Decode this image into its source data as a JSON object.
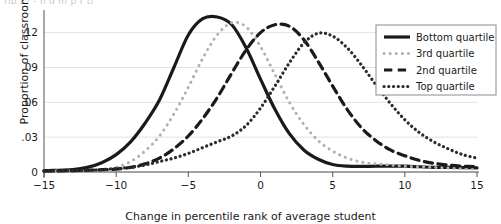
{
  "figure": {
    "caption_remnant": "rib f f ‑ h   d  m       p r          ti",
    "background": "#ffffff"
  },
  "chart_data": {
    "type": "line",
    "title": "",
    "subtitle": "",
    "xlabel": "Change in percentile rank of average student",
    "ylabel": "Proportion of classrooms",
    "xlim": [
      -15,
      15
    ],
    "ylim": [
      0,
      0.1395
    ],
    "xticks": [
      -15,
      -10,
      -5,
      0,
      5,
      10,
      15
    ],
    "xtick_labels": [
      "−15",
      "−10",
      "−5",
      "0",
      "5",
      "10",
      "15"
    ],
    "yticks": [
      0,
      0.03,
      0.06,
      0.09,
      0.12
    ],
    "ytick_labels": [
      "0",
      ".03",
      ".06",
      ".09",
      ".12"
    ],
    "grid": "horizontal",
    "grid_color": "#d9d9d9",
    "legend_position": "top-right",
    "x": [
      -15,
      -14,
      -13,
      -12,
      -11,
      -10,
      -9,
      -8,
      -7,
      -6,
      -5,
      -4,
      -3,
      -2,
      -1,
      0,
      1,
      2,
      3,
      4,
      5,
      6,
      7,
      8,
      9,
      10,
      11,
      12,
      13,
      14,
      15
    ],
    "series": [
      {
        "name": "Bottom quartile",
        "style": "solid",
        "color": "#1a1a1a",
        "width": 3.2,
        "peak_x": -4.3,
        "peak_y": 0.1335,
        "values": [
          0.001,
          0.0015,
          0.002,
          0.004,
          0.008,
          0.015,
          0.026,
          0.042,
          0.062,
          0.09,
          0.118,
          0.132,
          0.1335,
          0.127,
          0.107,
          0.08,
          0.054,
          0.033,
          0.019,
          0.011,
          0.0065,
          0.005,
          0.0048,
          0.005,
          0.005,
          0.005,
          0.0045,
          0.004,
          0.004,
          0.0038,
          0.0035
        ]
      },
      {
        "name": "3rd quartile",
        "style": "dotted",
        "color": "#b0b0b0",
        "width": 3.0,
        "peak_x": -2.1,
        "peak_y": 0.1285,
        "values": [
          0.0008,
          0.001,
          0.0012,
          0.0015,
          0.002,
          0.004,
          0.009,
          0.018,
          0.031,
          0.05,
          0.073,
          0.098,
          0.118,
          0.1285,
          0.125,
          0.108,
          0.084,
          0.06,
          0.041,
          0.027,
          0.018,
          0.012,
          0.0085,
          0.007,
          0.006,
          0.005,
          0.0045,
          0.004,
          0.0035,
          0.003,
          0.0028
        ]
      },
      {
        "name": "2nd quartile",
        "style": "dashed",
        "color": "#1a1a1a",
        "width": 3.2,
        "peak_x": 1.6,
        "peak_y": 0.127,
        "values": [
          0.001,
          0.001,
          0.0012,
          0.0015,
          0.002,
          0.0025,
          0.004,
          0.007,
          0.012,
          0.02,
          0.031,
          0.046,
          0.064,
          0.085,
          0.105,
          0.12,
          0.1268,
          0.1255,
          0.114,
          0.095,
          0.074,
          0.054,
          0.038,
          0.027,
          0.019,
          0.014,
          0.01,
          0.0075,
          0.006,
          0.005,
          0.0045
        ]
      },
      {
        "name": "Top quartile",
        "style": "densely-dotted",
        "color": "#2b2b2b",
        "width": 3.2,
        "peak_x": 3.9,
        "peak_y": 0.1195,
        "values": [
          0.0008,
          0.001,
          0.0012,
          0.0015,
          0.002,
          0.003,
          0.004,
          0.006,
          0.009,
          0.012,
          0.016,
          0.021,
          0.026,
          0.031,
          0.04,
          0.055,
          0.074,
          0.094,
          0.111,
          0.1195,
          0.117,
          0.107,
          0.092,
          0.075,
          0.059,
          0.045,
          0.034,
          0.026,
          0.02,
          0.015,
          0.012
        ]
      }
    ]
  },
  "legend": {
    "items": [
      {
        "label": "Bottom quartile"
      },
      {
        "label": "3rd quartile"
      },
      {
        "label": "2nd quartile"
      },
      {
        "label": "Top quartile"
      }
    ]
  }
}
